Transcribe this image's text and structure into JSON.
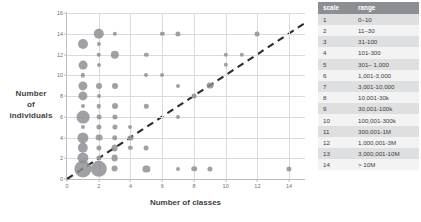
{
  "chart_data": {
    "type": "scatter",
    "title": "",
    "xlabel": "Number of classes",
    "ylabel": "Number of individuals",
    "xlim": [
      0,
      15
    ],
    "ylim": [
      0,
      16
    ],
    "xticks": [
      0,
      2,
      4,
      6,
      8,
      10,
      12,
      14
    ],
    "yticks": [
      0,
      2,
      4,
      6,
      8,
      10,
      12,
      14,
      16
    ],
    "grid": true,
    "legend": "none",
    "size_encoding": "bubble area = number of languages",
    "annotations": [
      {
        "kind": "reference-line",
        "style": "dashed",
        "label": "y = x",
        "from": [
          0,
          0
        ],
        "to": [
          15,
          15
        ]
      }
    ],
    "points": [
      {
        "x": 1,
        "y": 13,
        "size": 5.0
      },
      {
        "x": 1,
        "y": 11,
        "size": 4.4
      },
      {
        "x": 1,
        "y": 10,
        "size": 2.2
      },
      {
        "x": 1,
        "y": 9,
        "size": 4.6
      },
      {
        "x": 1,
        "y": 8,
        "size": 4.6
      },
      {
        "x": 1,
        "y": 7,
        "size": 2.0
      },
      {
        "x": 1,
        "y": 6,
        "size": 6.4
      },
      {
        "x": 1,
        "y": 5,
        "size": 2.0
      },
      {
        "x": 1,
        "y": 4,
        "size": 5.6
      },
      {
        "x": 1,
        "y": 3,
        "size": 5.2
      },
      {
        "x": 1,
        "y": 2,
        "size": 5.6
      },
      {
        "x": 1,
        "y": 1,
        "size": 8.6
      },
      {
        "x": 2,
        "y": 14,
        "size": 5.2
      },
      {
        "x": 2,
        "y": 13,
        "size": 2.1
      },
      {
        "x": 2,
        "y": 12,
        "size": 2.3
      },
      {
        "x": 2,
        "y": 11,
        "size": 2.0
      },
      {
        "x": 2,
        "y": 9,
        "size": 3.0
      },
      {
        "x": 2,
        "y": 8,
        "size": 2.0
      },
      {
        "x": 2,
        "y": 7,
        "size": 2.2
      },
      {
        "x": 2,
        "y": 6,
        "size": 2.4
      },
      {
        "x": 2,
        "y": 5,
        "size": 2.6
      },
      {
        "x": 2,
        "y": 4,
        "size": 3.4
      },
      {
        "x": 2,
        "y": 3,
        "size": 2.6
      },
      {
        "x": 2,
        "y": 2,
        "size": 2.6
      },
      {
        "x": 2,
        "y": 1,
        "size": 8.2
      },
      {
        "x": 3,
        "y": 14,
        "size": 2.2
      },
      {
        "x": 3,
        "y": 12,
        "size": 4.2
      },
      {
        "x": 3,
        "y": 9,
        "size": 3.0
      },
      {
        "x": 3,
        "y": 7,
        "size": 3.0
      },
      {
        "x": 3,
        "y": 6,
        "size": 2.6
      },
      {
        "x": 3,
        "y": 5,
        "size": 2.6
      },
      {
        "x": 3,
        "y": 4,
        "size": 2.8
      },
      {
        "x": 3,
        "y": 3,
        "size": 3.4
      },
      {
        "x": 3,
        "y": 2,
        "size": 3.4
      },
      {
        "x": 3,
        "y": 1,
        "size": 3.4
      },
      {
        "x": 4,
        "y": 5,
        "size": 2.0
      },
      {
        "x": 4,
        "y": 4,
        "size": 2.6
      },
      {
        "x": 4,
        "y": 3,
        "size": 2.2
      },
      {
        "x": 5,
        "y": 12,
        "size": 2.2
      },
      {
        "x": 5,
        "y": 10,
        "size": 2.0
      },
      {
        "x": 5,
        "y": 7,
        "size": 2.2
      },
      {
        "x": 5,
        "y": 3,
        "size": 2.4
      },
      {
        "x": 5,
        "y": 1,
        "size": 3.6
      },
      {
        "x": 6,
        "y": 14,
        "size": 2.2
      },
      {
        "x": 6,
        "y": 10,
        "size": 2.0
      },
      {
        "x": 7,
        "y": 14,
        "size": 2.6
      },
      {
        "x": 7,
        "y": 9,
        "size": 2.0
      },
      {
        "x": 7,
        "y": 6,
        "size": 2.0
      },
      {
        "x": 7,
        "y": 1,
        "size": 2.0
      },
      {
        "x": 8,
        "y": 8,
        "size": 2.4
      },
      {
        "x": 8,
        "y": 1,
        "size": 2.8
      },
      {
        "x": 9,
        "y": 9,
        "size": 3.4
      },
      {
        "x": 9,
        "y": 1,
        "size": 2.6
      },
      {
        "x": 10,
        "y": 12,
        "size": 2.2
      },
      {
        "x": 10,
        "y": 11,
        "size": 2.2
      },
      {
        "x": 11,
        "y": 12,
        "size": 2.2
      },
      {
        "x": 12,
        "y": 14,
        "size": 2.4
      },
      {
        "x": 14,
        "y": 1,
        "size": 2.6
      }
    ]
  },
  "scale_table": {
    "headers": {
      "scale": "scale",
      "range": "range"
    },
    "rows": [
      {
        "scale": "1",
        "range": "0–10"
      },
      {
        "scale": "2",
        "range": "11–30"
      },
      {
        "scale": "3",
        "range": "31-100"
      },
      {
        "scale": "4",
        "range": "101-300"
      },
      {
        "scale": "5",
        "range": "301– 1,000"
      },
      {
        "scale": "6",
        "range": "1,001-3,000"
      },
      {
        "scale": "7",
        "range": "3,001-10,000"
      },
      {
        "scale": "8",
        "range": "10,001-30k"
      },
      {
        "scale": "9",
        "range": "30,001-100k"
      },
      {
        "scale": "10",
        "range": "100,001-300k"
      },
      {
        "scale": "11",
        "range": "300,001-1M"
      },
      {
        "scale": "12",
        "range": "1,000,001-3M"
      },
      {
        "scale": "13",
        "range": "3,000,001-10M"
      },
      {
        "scale": "14",
        "range": "> 10M"
      }
    ]
  },
  "colors": {
    "bubble": "#8a8c91",
    "grid": "#d8dade",
    "axis": "#b9bcc4",
    "table_header_bg": "#8c8e93",
    "table_row_odd_bg": "#dedfe1",
    "table_row_even_bg": "#f3f3f4",
    "text": "#3a3a3a"
  }
}
